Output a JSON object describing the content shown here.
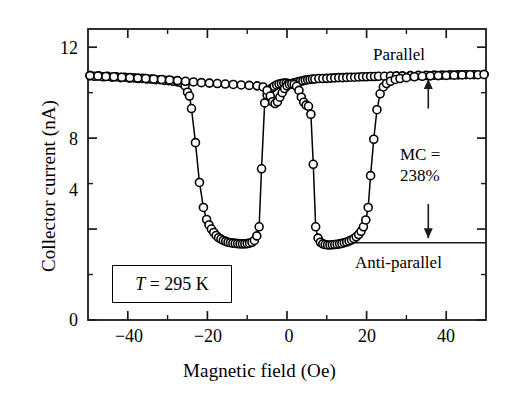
{
  "figure": {
    "caption_title": "Collector current vs magnetic field"
  },
  "axes": {
    "x_title": "Magnetic field (Oe)",
    "y_title": "Collector current (nA)",
    "x_ticks": [
      "−40",
      "−20",
      "0",
      "20",
      "40"
    ],
    "y_ticks": [
      "0",
      "4",
      "8",
      "12"
    ]
  },
  "annotations": {
    "parallel": "Parallel",
    "antiparallel": "Anti-parallel",
    "mc_line1": "MC =",
    "mc_line2": "238%",
    "temperature_t": "T",
    "temperature_rest": " = 295 K",
    "temperature_full": "T = 295 K"
  },
  "chart_data": {
    "type": "scatter",
    "title": "",
    "xlabel": "Magnetic field (Oe)",
    "ylabel": "Collector current (nA)",
    "xlim": [
      -50,
      50
    ],
    "ylim": [
      0,
      12.8
    ],
    "xticks": [
      -40,
      -20,
      0,
      20,
      40
    ],
    "xminorticks": [
      -30,
      -10,
      10,
      30
    ],
    "yticks": [
      0,
      4,
      8,
      12
    ],
    "yminorticks": [
      2,
      6,
      10
    ],
    "grid": false,
    "legend": "none",
    "marker": "open-circle",
    "marker_color": "#000000",
    "line_color": "#000000",
    "annotations": [
      {
        "text": "Parallel",
        "x": 33,
        "y": 11.7
      },
      {
        "text": "Anti-parallel",
        "x": 30,
        "y": 2.45
      },
      {
        "text": "MC = 238%",
        "x": 35,
        "y": 7.1
      },
      {
        "text": "T = 295 K",
        "x": -37,
        "y": 1.6
      }
    ],
    "reference_lines": [
      {
        "orientation": "horizontal",
        "y": 3.4,
        "x_from": 11,
        "x_to": 50,
        "label": "Anti-parallel level"
      }
    ],
    "arrows": [
      {
        "from": [
          35.5,
          9.3
        ],
        "to": [
          35.5,
          10.6
        ],
        "style": "single-head-up"
      },
      {
        "from": [
          35.5,
          5.1
        ],
        "to": [
          35.5,
          3.6
        ],
        "style": "single-head-down"
      }
    ],
    "series": [
      {
        "name": "Decreasing field sweep (negative-going branch)",
        "points": [
          [
            -49.5,
            10.75
          ],
          [
            -48.4,
            10.72
          ],
          [
            -47.3,
            10.74
          ],
          [
            -46.2,
            10.7
          ],
          [
            -45.1,
            10.72
          ],
          [
            -44.0,
            10.68
          ],
          [
            -42.9,
            10.7
          ],
          [
            -41.8,
            10.66
          ],
          [
            -40.7,
            10.68
          ],
          [
            -39.6,
            10.64
          ],
          [
            -38.5,
            10.65
          ],
          [
            -37.4,
            10.62
          ],
          [
            -36.3,
            10.63
          ],
          [
            -35.2,
            10.6
          ],
          [
            -34.1,
            10.6
          ],
          [
            -33.0,
            10.57
          ],
          [
            -31.9,
            10.57
          ],
          [
            -30.8,
            10.54
          ],
          [
            -29.7,
            10.53
          ],
          [
            -28.6,
            10.5
          ],
          [
            -27.5,
            10.47
          ],
          [
            -26.4,
            10.42
          ],
          [
            -25.6,
            10.3
          ],
          [
            -25.0,
            10.02
          ],
          [
            -24.5,
            9.85
          ],
          [
            -24.0,
            9.3
          ],
          [
            -23.0,
            7.8
          ],
          [
            -22.0,
            6.05
          ],
          [
            -21.0,
            4.95
          ],
          [
            -20.2,
            4.42
          ],
          [
            -19.6,
            4.18
          ],
          [
            -19.0,
            4.0
          ],
          [
            -18.4,
            3.85
          ],
          [
            -17.8,
            3.72
          ],
          [
            -17.2,
            3.62
          ],
          [
            -16.6,
            3.56
          ],
          [
            -16.0,
            3.5
          ],
          [
            -15.4,
            3.46
          ],
          [
            -14.8,
            3.42
          ],
          [
            -14.2,
            3.4
          ],
          [
            -13.6,
            3.38
          ],
          [
            -13.0,
            3.37
          ],
          [
            -12.4,
            3.36
          ],
          [
            -11.8,
            3.35
          ],
          [
            -11.2,
            3.35
          ],
          [
            -10.6,
            3.35
          ],
          [
            -10.0,
            3.36
          ],
          [
            -9.4,
            3.38
          ],
          [
            -8.8,
            3.42
          ],
          [
            -8.2,
            3.5
          ],
          [
            -7.6,
            3.7
          ],
          [
            -7.0,
            4.1
          ],
          [
            -6.4,
            6.65
          ],
          [
            -5.6,
            9.55
          ],
          [
            -5.0,
            9.9
          ],
          [
            -4.4,
            10.08
          ],
          [
            -3.8,
            10.2
          ],
          [
            -3.2,
            10.28
          ],
          [
            -2.6,
            10.34
          ],
          [
            -2.0,
            10.38
          ],
          [
            -1.4,
            10.4
          ],
          [
            -0.8,
            10.42
          ],
          [
            -0.2,
            10.42
          ],
          [
            0.4,
            10.4
          ],
          [
            1.0,
            10.38
          ],
          [
            1.6,
            10.42
          ],
          [
            2.2,
            10.45
          ],
          [
            2.8,
            10.48
          ],
          [
            3.4,
            10.5
          ],
          [
            4.0,
            10.52
          ],
          [
            4.6,
            10.55
          ],
          [
            5.2,
            10.57
          ],
          [
            5.8,
            10.58
          ],
          [
            6.4,
            10.6
          ],
          [
            7.0,
            10.6
          ],
          [
            8.0,
            10.62
          ],
          [
            9.0,
            10.62
          ],
          [
            10.0,
            10.63
          ],
          [
            11.0,
            10.64
          ],
          [
            12.0,
            10.65
          ],
          [
            13.0,
            10.66
          ],
          [
            14.0,
            10.66
          ],
          [
            15.0,
            10.67
          ],
          [
            16.0,
            10.68
          ],
          [
            17.0,
            10.68
          ],
          [
            18.0,
            10.69
          ],
          [
            19.0,
            10.7
          ],
          [
            20.0,
            10.7
          ],
          [
            21.0,
            10.71
          ],
          [
            22.0,
            10.71
          ],
          [
            23.0,
            10.72
          ],
          [
            24.5,
            10.72
          ],
          [
            26.0,
            10.73
          ],
          [
            27.5,
            10.74
          ],
          [
            29.0,
            10.74
          ],
          [
            31.0,
            10.75
          ],
          [
            33.0,
            10.76
          ],
          [
            35.0,
            10.76
          ],
          [
            37.0,
            10.77
          ],
          [
            39.0,
            10.77
          ],
          [
            41.0,
            10.78
          ],
          [
            43.0,
            10.78
          ],
          [
            45.0,
            10.79
          ],
          [
            47.0,
            10.79
          ],
          [
            49.5,
            10.8
          ]
        ]
      },
      {
        "name": "Increasing field sweep (positive-going branch)",
        "points": [
          [
            -49.5,
            10.75
          ],
          [
            -47.5,
            10.73
          ],
          [
            -45.5,
            10.71
          ],
          [
            -43.5,
            10.7
          ],
          [
            -41.5,
            10.68
          ],
          [
            -39.5,
            10.66
          ],
          [
            -37.5,
            10.64
          ],
          [
            -35.5,
            10.62
          ],
          [
            -33.5,
            10.6
          ],
          [
            -31.5,
            10.58
          ],
          [
            -29.5,
            10.56
          ],
          [
            -27.5,
            10.53
          ],
          [
            -25.5,
            10.5
          ],
          [
            -23.5,
            10.47
          ],
          [
            -21.5,
            10.44
          ],
          [
            -19.5,
            10.42
          ],
          [
            -17.5,
            10.4
          ],
          [
            -15.5,
            10.38
          ],
          [
            -13.5,
            10.36
          ],
          [
            -11.5,
            10.34
          ],
          [
            -9.5,
            10.32
          ],
          [
            -7.5,
            10.3
          ],
          [
            -6.0,
            10.25
          ],
          [
            -5.0,
            10.1
          ],
          [
            -4.2,
            9.85
          ],
          [
            -3.6,
            9.6
          ],
          [
            -3.0,
            9.52
          ],
          [
            -2.4,
            9.6
          ],
          [
            -1.8,
            9.8
          ],
          [
            -1.2,
            10.0
          ],
          [
            -0.6,
            10.18
          ],
          [
            0.0,
            10.3
          ],
          [
            0.6,
            10.36
          ],
          [
            1.2,
            10.38
          ],
          [
            1.8,
            10.36
          ],
          [
            2.4,
            10.28
          ],
          [
            3.0,
            10.1
          ],
          [
            3.6,
            9.8
          ],
          [
            4.2,
            9.58
          ],
          [
            4.8,
            9.45
          ],
          [
            5.4,
            9.4
          ],
          [
            6.0,
            9.05
          ],
          [
            6.6,
            6.85
          ],
          [
            7.2,
            4.1
          ],
          [
            7.8,
            3.6
          ],
          [
            8.4,
            3.42
          ],
          [
            9.0,
            3.35
          ],
          [
            9.6,
            3.32
          ],
          [
            10.2,
            3.3
          ],
          [
            10.8,
            3.3
          ],
          [
            11.4,
            3.31
          ],
          [
            12.0,
            3.32
          ],
          [
            12.6,
            3.33
          ],
          [
            13.2,
            3.35
          ],
          [
            13.8,
            3.37
          ],
          [
            14.4,
            3.4
          ],
          [
            15.0,
            3.43
          ],
          [
            15.6,
            3.47
          ],
          [
            16.2,
            3.52
          ],
          [
            16.8,
            3.58
          ],
          [
            17.4,
            3.66
          ],
          [
            18.0,
            3.76
          ],
          [
            18.6,
            3.9
          ],
          [
            19.2,
            4.1
          ],
          [
            19.8,
            4.4
          ],
          [
            20.4,
            4.95
          ],
          [
            21.0,
            6.35
          ],
          [
            21.8,
            7.95
          ],
          [
            22.6,
            9.25
          ],
          [
            23.4,
            9.95
          ],
          [
            24.2,
            10.25
          ],
          [
            25.0,
            10.4
          ],
          [
            26.0,
            10.5
          ],
          [
            27.2,
            10.58
          ],
          [
            28.4,
            10.62
          ],
          [
            30.0,
            10.66
          ],
          [
            32.0,
            10.7
          ],
          [
            34.0,
            10.72
          ],
          [
            36.0,
            10.74
          ],
          [
            38.0,
            10.75
          ],
          [
            40.0,
            10.76
          ],
          [
            42.0,
            10.77
          ],
          [
            44.0,
            10.78
          ],
          [
            46.0,
            10.79
          ],
          [
            48.0,
            10.79
          ],
          [
            49.5,
            10.8
          ]
        ]
      }
    ]
  }
}
